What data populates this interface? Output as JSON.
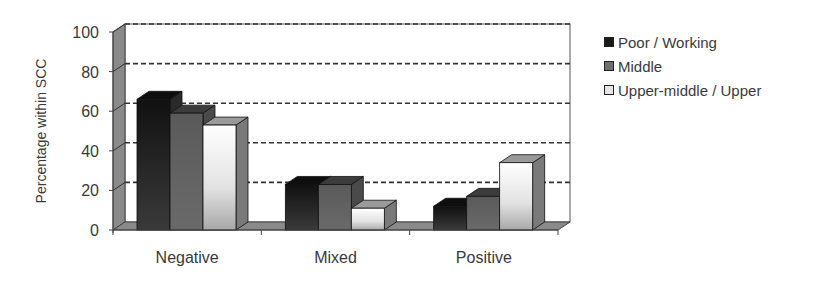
{
  "chart_data": {
    "type": "bar",
    "style": "3d-clustered-column",
    "title": "",
    "xlabel": "",
    "ylabel": "Percentage within SCC",
    "ylim": [
      0,
      100
    ],
    "yticks": [
      0,
      20,
      40,
      60,
      80,
      100
    ],
    "grid": true,
    "grid_style": "dashed",
    "legend_position": "right",
    "categories": [
      "Negative",
      "Mixed",
      "Positive"
    ],
    "series": [
      {
        "name": "Poor / Working",
        "values": [
          66,
          23,
          12
        ],
        "color": "#1a1a1a"
      },
      {
        "name": "Middle",
        "values": [
          59,
          23,
          17
        ],
        "color": "#6e6e6e"
      },
      {
        "name": "Upper-middle / Upper",
        "values": [
          53,
          11,
          34
        ],
        "color": "#e6e6e6"
      }
    ]
  },
  "legend": {
    "items": [
      {
        "label": "Poor / Working",
        "color": "#1a1a1a"
      },
      {
        "label": "Middle",
        "color": "#6e6e6e"
      },
      {
        "label": "Upper-middle / Upper",
        "color": "#e6e6e6"
      }
    ]
  }
}
